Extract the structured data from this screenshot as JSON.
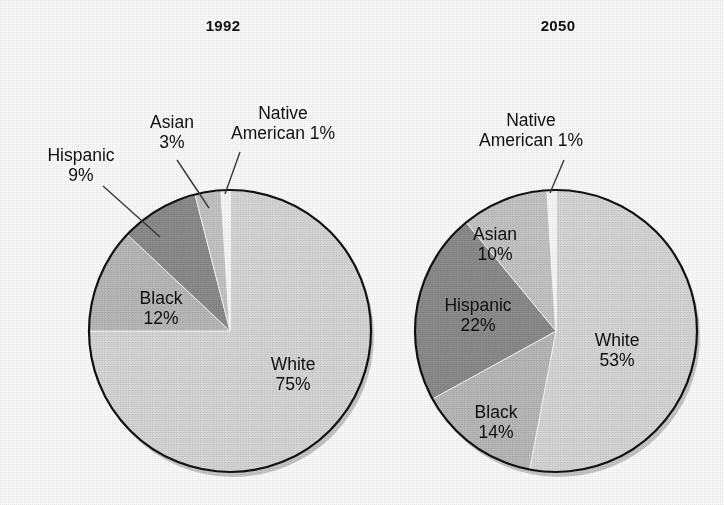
{
  "figure": {
    "background": "#ffffff",
    "ink": "#101010",
    "style": "scanned grayscale figure with two pie charts"
  },
  "palette": {
    "white_slice": "#dcdcdc",
    "black_slice": "#bdbdbd",
    "hispanic_slice": "#8f8f8f",
    "asian_slice": "#c9c9c9",
    "native_american_slice": "#ffffff",
    "outline": "#111111",
    "shadow": "#9a9a9a",
    "leader_line": "#3a3a3a"
  },
  "chart_data": [
    {
      "type": "pie",
      "title": "1992",
      "categories": [
        "White",
        "Black",
        "Hispanic",
        "Asian",
        "Native American"
      ],
      "values": [
        75,
        12,
        9,
        3,
        1
      ],
      "value_unit": "%",
      "labels": [
        {
          "name": "White",
          "value": 75,
          "text_line1": "White",
          "text_line2": "75%",
          "placement": "inside"
        },
        {
          "name": "Black",
          "value": 12,
          "text_line1": "Black",
          "text_line2": "12%",
          "placement": "inside"
        },
        {
          "name": "Hispanic",
          "value": 9,
          "text_line1": "Hispanic",
          "text_line2": "9%",
          "placement": "callout"
        },
        {
          "name": "Asian",
          "value": 3,
          "text_line1": "Asian",
          "text_line2": "3%",
          "placement": "callout"
        },
        {
          "name": "Native American",
          "value": 1,
          "text_line1": "Native",
          "text_line2": "American 1%",
          "placement": "callout"
        }
      ],
      "center": [
        230,
        331
      ],
      "radius": 141,
      "start_angle_deg": 0,
      "direction": "clockwise",
      "legend": "none",
      "grid": false
    },
    {
      "type": "pie",
      "title": "2050",
      "categories": [
        "White",
        "Black",
        "Hispanic",
        "Asian",
        "Native American"
      ],
      "values": [
        53,
        14,
        22,
        10,
        1
      ],
      "value_unit": "%",
      "labels": [
        {
          "name": "White",
          "value": 53,
          "text_line1": "White",
          "text_line2": "53%",
          "placement": "inside"
        },
        {
          "name": "Black",
          "value": 14,
          "text_line1": "Black",
          "text_line2": "14%",
          "placement": "inside"
        },
        {
          "name": "Hispanic",
          "value": 22,
          "text_line1": "Hispanic",
          "text_line2": "22%",
          "placement": "inside"
        },
        {
          "name": "Asian",
          "value": 10,
          "text_line1": "Asian",
          "text_line2": "10%",
          "placement": "inside"
        },
        {
          "name": "Native American",
          "value": 1,
          "text_line1": "Native",
          "text_line2": "American 1%",
          "placement": "callout"
        }
      ],
      "center": [
        556,
        331
      ],
      "radius": 141,
      "start_angle_deg": 0,
      "direction": "clockwise",
      "legend": "none",
      "grid": false
    }
  ],
  "chart1992": {
    "title": "1992",
    "callout_hispanic_l1": "Hispanic",
    "callout_hispanic_l2": "9%",
    "callout_asian_l1": "Asian",
    "callout_asian_l2": "3%",
    "callout_native_l1": "Native",
    "callout_native_l2": "American 1%",
    "inside_black_l1": "Black",
    "inside_black_l2": "12%",
    "inside_white_l1": "White",
    "inside_white_l2": "75%"
  },
  "chart2050": {
    "title": "2050",
    "callout_native_l1": "Native",
    "callout_native_l2": "American 1%",
    "inside_asian_l1": "Asian",
    "inside_asian_l2": "10%",
    "inside_hispanic_l1": "Hispanic",
    "inside_hispanic_l2": "22%",
    "inside_black_l1": "Black",
    "inside_black_l2": "14%",
    "inside_white_l1": "White",
    "inside_white_l2": "53%"
  }
}
